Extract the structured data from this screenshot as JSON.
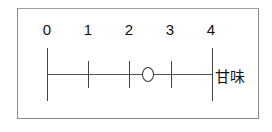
{
  "scale": {
    "ticks": [
      {
        "label": "0",
        "value": 0
      },
      {
        "label": "1",
        "value": 1
      },
      {
        "label": "2",
        "value": 2
      },
      {
        "label": "3",
        "value": 3
      },
      {
        "label": "4",
        "value": 4
      }
    ],
    "axis_label": "甘味",
    "marker": {
      "shape": "circle",
      "value": 2.5
    }
  }
}
